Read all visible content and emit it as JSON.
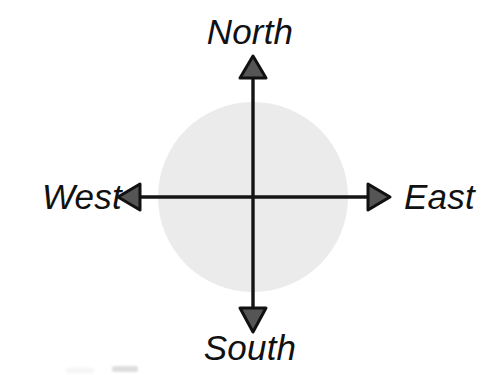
{
  "figure": {
    "kind": "compass-rose-diagram",
    "width": 500,
    "height": 375,
    "background_color": "#ffffff"
  },
  "labels": {
    "north": "North",
    "south": "South",
    "west": "West",
    "east": "East"
  },
  "colors": {
    "background": "#ffffff",
    "circle_fill": "#ebebeb",
    "axis_stroke": "#141414",
    "arrowhead_fill": "#555555",
    "arrowhead_stroke": "#111111",
    "label_text": "#111111"
  },
  "geometry": {
    "center_x": 253,
    "center_y": 197,
    "circle_radius": 95,
    "vertical_axis": {
      "x": 253,
      "top_y": 62,
      "bottom_y": 330
    },
    "horizontal_axis": {
      "y": 197,
      "left_x": 122,
      "right_x": 388
    },
    "arrowhead_width": 26,
    "arrowhead_length": 22,
    "axis_stroke_width": 3.2
  }
}
